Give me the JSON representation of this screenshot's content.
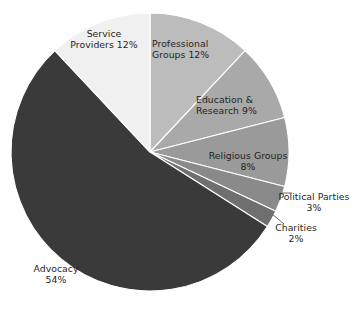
{
  "chart_data": {
    "type": "pie",
    "title": "",
    "subtitle": "",
    "xlabel": "",
    "ylabel": "",
    "legend_position": "none",
    "grid": false,
    "units": "percent",
    "total": 100,
    "start_angle_deg": 0,
    "direction": "clockwise",
    "center": {
      "x": 150,
      "y": 152
    },
    "radius": 139,
    "categories": [
      "Professional Groups",
      "Education & Research",
      "Religious Groups",
      "Political Parties",
      "Charities",
      "Advocacy",
      "Service Providers"
    ],
    "values": [
      12,
      9,
      8,
      3,
      2,
      54,
      12
    ],
    "slices": [
      {
        "name": "Professional Groups",
        "value": 12,
        "value_label": "12%",
        "label_text": "Professional\nGroups 12%",
        "color": "#bcbcbc",
        "label_placement": "inside",
        "start_deg": 0,
        "end_deg": 43.2
      },
      {
        "name": "Education & Research",
        "value": 9,
        "value_label": "9%",
        "label_text": "Education &\nResearch 9%",
        "color": "#a9a9a9",
        "label_placement": "inside",
        "start_deg": 43.2,
        "end_deg": 75.6
      },
      {
        "name": "Religious Groups",
        "value": 8,
        "value_label": "8%",
        "label_text": "Religious Groups\n8%",
        "color": "#9a9a9a",
        "label_placement": "inside",
        "start_deg": 75.6,
        "end_deg": 104.4
      },
      {
        "name": "Political Parties",
        "value": 3,
        "value_label": "3%",
        "label_text": "Political Parties\n3%",
        "color": "#8a8a8a",
        "label_placement": "outside",
        "start_deg": 104.4,
        "end_deg": 115.2
      },
      {
        "name": "Charities",
        "value": 2,
        "value_label": "2%",
        "label_text": "Charities\n2%",
        "color": "#6f6f6f",
        "label_placement": "outside",
        "start_deg": 115.2,
        "end_deg": 122.4
      },
      {
        "name": "Advocacy",
        "value": 54,
        "value_label": "54%",
        "label_text": "Advocacy\n54%",
        "color": "#3a3a3a",
        "label_placement": "outside",
        "start_deg": 122.4,
        "end_deg": 316.8
      },
      {
        "name": "Service Providers",
        "value": 12,
        "value_label": "12%",
        "label_text": "Service\nProviders 12%",
        "color": "#f0f0f0",
        "label_placement": "inside",
        "start_deg": 316.8,
        "end_deg": 360
      }
    ],
    "colors": {
      "background": "#ffffff",
      "slice_border": "#ffffff",
      "leader_line": "#5a5a5a",
      "label_text": "#1f1f1f"
    }
  }
}
